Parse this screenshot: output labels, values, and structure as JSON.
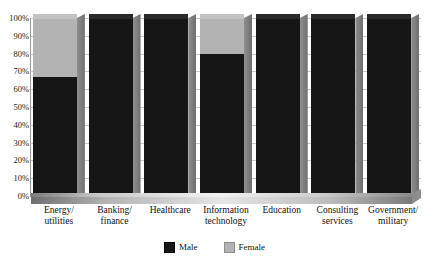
{
  "title_remnant": "",
  "legend": {
    "position": "bottom-center",
    "items": [
      {
        "label": "Male",
        "color": "#161616",
        "icon": "square-swatch-icon"
      },
      {
        "label": "Female",
        "color": "#b3b3b3",
        "icon": "square-swatch-icon"
      }
    ]
  },
  "yaxis": {
    "ticks": [
      "100%",
      "90%",
      "80%",
      "70%",
      "60%",
      "50%",
      "40%",
      "30%",
      "20%",
      "10%",
      "0%"
    ]
  },
  "chart_data": {
    "type": "bar",
    "subtype": "100% stacked column (3D)",
    "title": "",
    "xlabel": "",
    "ylabel": "",
    "ylim": [
      0,
      100
    ],
    "ytick_labels": [
      "0%",
      "10%",
      "20%",
      "30%",
      "40%",
      "50%",
      "60%",
      "70%",
      "80%",
      "90%",
      "100%"
    ],
    "grid": true,
    "legend_position": "bottom-center",
    "categories": [
      "Energy/\nutilities",
      "Banking/\nfinance",
      "Healthcare",
      "Information\ntechnology",
      "Education",
      "Consulting\nservices",
      "Government/\nmilitary"
    ],
    "category_labels": [
      [
        "Energy/",
        "utilities"
      ],
      [
        "Banking/",
        "finance"
      ],
      [
        "Healthcare",
        ""
      ],
      [
        "Information",
        "technology"
      ],
      [
        "Education",
        ""
      ],
      [
        "Consulting",
        "services"
      ],
      [
        "Government/",
        "military"
      ]
    ],
    "series": [
      {
        "name": "Male",
        "color": "#161616",
        "values": [
          67,
          100,
          100,
          80,
          100,
          100,
          100
        ]
      },
      {
        "name": "Female",
        "color": "#b3b3b3",
        "values": [
          33,
          0,
          0,
          20,
          0,
          0,
          0
        ]
      }
    ]
  }
}
